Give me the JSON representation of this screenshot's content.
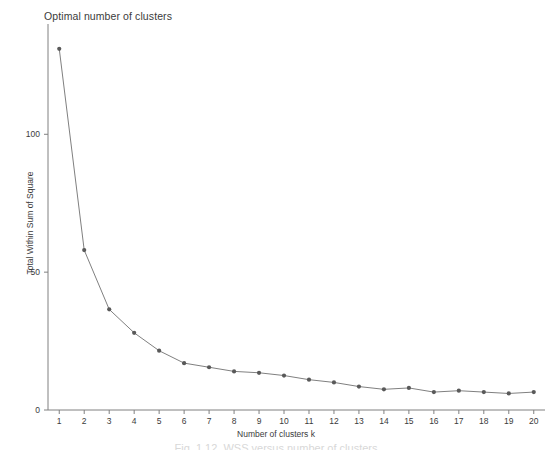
{
  "chart_data": {
    "type": "line",
    "title": "Optimal number of clusters",
    "xlabel": "Number of clusters k",
    "ylabel": "Total Within Sum of Square",
    "x": [
      1,
      2,
      3,
      4,
      5,
      6,
      7,
      8,
      9,
      10,
      11,
      12,
      13,
      14,
      15,
      16,
      17,
      18,
      19,
      20
    ],
    "values": [
      131,
      58,
      36.5,
      28,
      21.5,
      17,
      15.5,
      14,
      13.5,
      12.5,
      11,
      10,
      8.5,
      7.5,
      8,
      6.5,
      7,
      6.5,
      6,
      6.5
    ],
    "series": [
      {
        "name": "Total within sum of square",
        "values": [
          131,
          58,
          36.5,
          28,
          21.5,
          17,
          15.5,
          14,
          13.5,
          12.5,
          11,
          10,
          8.5,
          7.5,
          8,
          6.5,
          7,
          6.5,
          6,
          6.5
        ]
      }
    ],
    "xlim": [
      0.55,
      20.45
    ],
    "ylim": [
      0,
      140
    ],
    "x_ticks": [
      "1",
      "2",
      "3",
      "4",
      "5",
      "6",
      "7",
      "8",
      "9",
      "10",
      "11",
      "12",
      "13",
      "14",
      "15",
      "16",
      "17",
      "18",
      "19",
      "20"
    ],
    "y_ticks": [
      "0",
      "50",
      "100"
    ],
    "y_tick_values": [
      0,
      50,
      100
    ],
    "grid": false,
    "legend": false,
    "marker": "point",
    "line_color": "#808080",
    "marker_color": "#595959",
    "axis_color": "#808080",
    "text_color": "#3b3b3b",
    "background": "#ffffff"
  },
  "caption": {
    "partial_text": "Fig. 1.12. WSS versus number of clusters"
  }
}
